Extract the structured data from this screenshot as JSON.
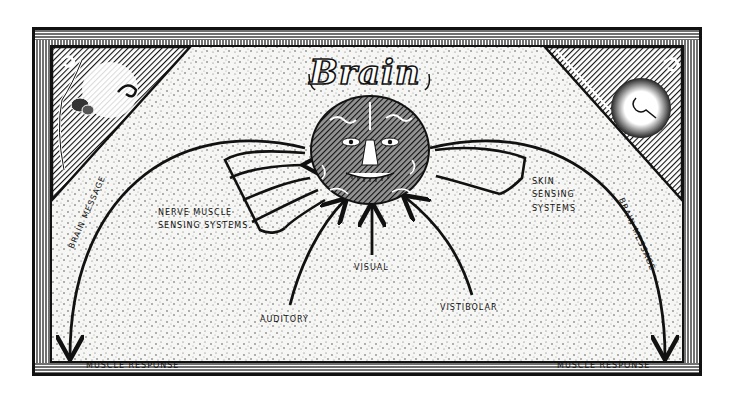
{
  "diagram": {
    "title": "Brain",
    "center_node": {
      "label": "Brain",
      "depiction": "brain-with-face"
    },
    "inputs": [
      {
        "id": "nerve-muscle",
        "label_line1": "NERVE MUSCLE",
        "label_line2": "SENSING SYSTEMS."
      },
      {
        "id": "skin",
        "label_line1": "SKIN",
        "label_line2": "SENSING",
        "label_line3": "SYSTEMS"
      },
      {
        "id": "visual",
        "label": "VISUAL"
      },
      {
        "id": "auditory",
        "label": "AUDITORY"
      },
      {
        "id": "vestibular",
        "label": "VISTIBOLAR"
      }
    ],
    "outputs": [
      {
        "id": "left",
        "path_label": "BRAIN MESSAGE",
        "target_label": "MUSCLE RESPONSE"
      },
      {
        "id": "right",
        "path_label": "BRAIN MESSAGE",
        "target_label": "MUSCLE RESPONSE"
      }
    ],
    "corner_art": {
      "top_left": "flower-and-swirls-icon",
      "top_right": "lightbulb-burst-icon"
    },
    "colors": {
      "ink": "#111111",
      "paper": "#f4f4f2",
      "background": "#ffffff"
    }
  }
}
